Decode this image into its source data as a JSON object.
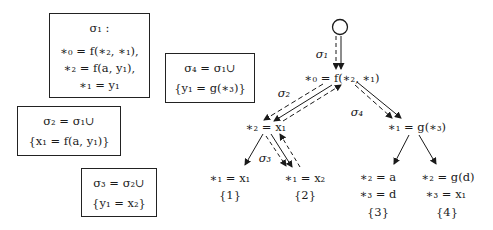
{
  "boxes": {
    "sigma1": {
      "title": "σ₁ :",
      "lines": [
        "∗₀ = f(∗₂, ∗₁),",
        "∗₂ = f(a, y₁),",
        "∗₁ = y₁"
      ]
    },
    "sigma2": {
      "lines": [
        "σ₂ = σ₁∪",
        "{x₁ = f(a, y₁)}"
      ]
    },
    "sigma3": {
      "lines": [
        "σ₃ = σ₂∪",
        "{y₁ = x₂}"
      ]
    },
    "sigma4": {
      "lines": [
        "σ₄ = σ₁∪",
        "{y₁ = g(∗₃)}"
      ]
    }
  },
  "tree": {
    "root": "∗₀ = f(∗₂, ∗₁)",
    "left": "∗₂ = x₁",
    "right": "∗₁ = g(∗₃)",
    "leaves": [
      {
        "lines": [
          "∗₁ = x₁"
        ],
        "set": "{1}"
      },
      {
        "lines": [
          "∗₁ = x₂"
        ],
        "set": "{2}"
      },
      {
        "lines": [
          "∗₂ = a",
          "∗₃ = d"
        ],
        "set": "{3}"
      },
      {
        "lines": [
          "∗₂ = g(d)",
          "∗₃ = x₁"
        ],
        "set": "{4}"
      }
    ],
    "edge_labels": {
      "s1": "σ₁",
      "s2": "σ₂",
      "s3": "σ₃",
      "s4": "σ₄"
    }
  },
  "colors": {
    "ink": "#1a1a1a",
    "background": "#ffffff"
  }
}
